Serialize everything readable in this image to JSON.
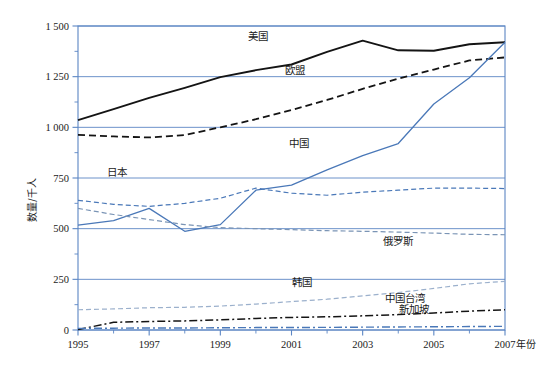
{
  "chart_data": {
    "type": "line",
    "title": "",
    "xlabel": "年份",
    "ylabel": "数量/千人",
    "xlim": [
      1995,
      2007
    ],
    "ylim": [
      0,
      1500
    ],
    "grid": true,
    "legend": "inline-labels",
    "x": [
      1995,
      1996,
      1997,
      1998,
      1999,
      2000,
      2001,
      2002,
      2003,
      2004,
      2005,
      2006,
      2007
    ],
    "xticks": [
      "1995",
      "1997",
      "1999",
      "2001",
      "2003",
      "2005",
      "2007"
    ],
    "xtick_values": [
      1995,
      1997,
      1999,
      2001,
      2003,
      2005,
      2007
    ],
    "yticks": [
      "0",
      "250",
      "500",
      "750",
      "1 000",
      "1 250",
      "1 500"
    ],
    "ytick_values": [
      0,
      250,
      500,
      750,
      1000,
      1250,
      1500
    ],
    "series": [
      {
        "name": "美国",
        "style": "solid",
        "color": "#141414",
        "width": 1.9,
        "label_x": 2000.05,
        "label_y": 1430,
        "values": [
          1036,
          1090,
          1145,
          1195,
          1248,
          1282,
          1310,
          1372,
          1428,
          1380,
          1378,
          1410,
          1420
        ]
      },
      {
        "name": "欧盟",
        "style": "dashed",
        "color": "#141414",
        "width": 1.8,
        "label_x": 2001.1,
        "label_y": 1265,
        "values": [
          963,
          955,
          950,
          962,
          1000,
          1040,
          1085,
          1135,
          1190,
          1240,
          1285,
          1330,
          1345
        ]
      },
      {
        "name": "中国",
        "style": "solid",
        "color": "#4a78b8",
        "width": 1.3,
        "label_x": 2001.2,
        "label_y": 905,
        "values": [
          518,
          540,
          600,
          487,
          520,
          690,
          715,
          790,
          860,
          920,
          1115,
          1245,
          1420
        ]
      },
      {
        "name": "日本",
        "style": "dashed",
        "color": "#4a78b8",
        "width": 1.2,
        "label_x": 1996.1,
        "label_y": 760,
        "values": [
          640,
          620,
          610,
          625,
          650,
          700,
          675,
          665,
          680,
          690,
          700,
          700,
          698
        ]
      },
      {
        "name": "俄罗斯",
        "style": "dashed",
        "color": "#7a94b5",
        "width": 1.2,
        "label_x": 2004.0,
        "label_y": 420,
        "values": [
          600,
          570,
          545,
          520,
          505,
          500,
          495,
          490,
          487,
          483,
          478,
          472,
          470
        ]
      },
      {
        "name": "韩国",
        "style": "dashed",
        "color": "#9bb0cc",
        "width": 1.2,
        "label_x": 2001.3,
        "label_y": 215,
        "values": [
          100,
          104,
          110,
          112,
          118,
          128,
          140,
          152,
          168,
          185,
          205,
          228,
          240
        ]
      },
      {
        "name": "中国台湾",
        "style": "dashdot",
        "color": "#141414",
        "width": 1.5,
        "label_x": 2004.2,
        "label_y": 140,
        "values": [
          2,
          38,
          42,
          45,
          50,
          57,
          62,
          65,
          70,
          76,
          84,
          93,
          100
        ]
      },
      {
        "name": "新加坡",
        "style": "dashdot",
        "color": "#4a78b8",
        "width": 1.4,
        "label_x": 2004.45,
        "label_y": 82,
        "values": [
          8,
          9,
          10,
          10,
          11,
          12,
          12,
          13,
          14,
          15,
          16,
          17,
          18
        ]
      }
    ]
  },
  "colors": {
    "axis": "#5b86c4",
    "grid": "#5b86c4",
    "text": "#1a1a1a",
    "background": "#ffffff"
  }
}
